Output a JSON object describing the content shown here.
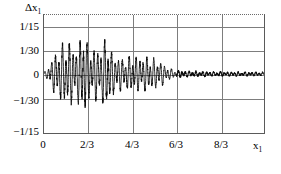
{
  "figure": {
    "background_color": "#ffffff",
    "frame_color": "#5a5a5a",
    "grid_color": "#7d7d7d",
    "curve_color": "#0a0a0a"
  },
  "axes": {
    "y_title": "Δx",
    "y_title_sub": "1",
    "x_title": "x",
    "x_title_sub": "1",
    "y_ticks": [
      {
        "label": "1/15",
        "value": 0.0666667
      },
      {
        "label": "1/30",
        "value": 0.0333333
      },
      {
        "label": "0",
        "value": 0
      },
      {
        "label": "−1/30",
        "value": -0.0333333
      },
      {
        "label": "−1/15",
        "value": -0.0666667
      }
    ],
    "x_ticks": [
      {
        "label": "0",
        "value": 0
      },
      {
        "label": "2/3",
        "value": 0.6666667
      },
      {
        "label": "4/3",
        "value": 1.3333333
      },
      {
        "label": "6/3",
        "value": 2.0
      },
      {
        "label": "8/3",
        "value": 2.6666667
      }
    ]
  },
  "chart_data": {
    "type": "line",
    "title": "",
    "subtitle": "",
    "xlabel": "x1",
    "ylabel": "Δx1",
    "xlim": [
      0,
      3.3333333
    ],
    "ylim": [
      -0.08,
      0.08
    ],
    "grid": true,
    "legend": null,
    "series": [
      {
        "name": "Δx1",
        "envelope_points": [
          {
            "x": 0.0,
            "amp": 0.0015
          },
          {
            "x": 0.06,
            "amp": 0.009
          },
          {
            "x": 0.12,
            "amp": 0.02
          },
          {
            "x": 0.18,
            "amp": 0.03
          },
          {
            "x": 0.24,
            "amp": 0.036
          },
          {
            "x": 0.3,
            "amp": 0.0415
          },
          {
            "x": 0.36,
            "amp": 0.047
          },
          {
            "x": 0.42,
            "amp": 0.04
          },
          {
            "x": 0.48,
            "amp": 0.0355
          },
          {
            "x": 0.54,
            "amp": 0.043
          },
          {
            "x": 0.6,
            "amp": 0.066
          },
          {
            "x": 0.66,
            "amp": 0.038
          },
          {
            "x": 0.72,
            "amp": 0.033
          },
          {
            "x": 0.78,
            "amp": 0.037
          },
          {
            "x": 0.84,
            "amp": 0.033
          },
          {
            "x": 0.9,
            "amp": 0.043
          },
          {
            "x": 0.96,
            "amp": 0.052
          },
          {
            "x": 1.02,
            "amp": 0.03
          },
          {
            "x": 1.08,
            "amp": 0.0265
          },
          {
            "x": 1.14,
            "amp": 0.023
          },
          {
            "x": 1.2,
            "amp": 0.0215
          },
          {
            "x": 1.3,
            "amp": 0.0235
          },
          {
            "x": 1.4,
            "amp": 0.0245
          },
          {
            "x": 1.5,
            "amp": 0.024
          },
          {
            "x": 1.6,
            "amp": 0.023
          },
          {
            "x": 1.7,
            "amp": 0.02
          },
          {
            "x": 1.8,
            "amp": 0.015
          },
          {
            "x": 1.9,
            "amp": 0.008
          },
          {
            "x": 2.0,
            "amp": 0.0042
          },
          {
            "x": 2.2,
            "amp": 0.0034
          },
          {
            "x": 2.5,
            "amp": 0.003
          },
          {
            "x": 2.8,
            "amp": 0.0026
          },
          {
            "x": 3.1,
            "amp": 0.0024
          },
          {
            "x": 3.34,
            "amp": 0.0022
          }
        ],
        "carrier_frequency_rad": 118.0,
        "note": "Curve rendered as amplitude-modulated oscillation sampled from the envelope above."
      }
    ]
  }
}
